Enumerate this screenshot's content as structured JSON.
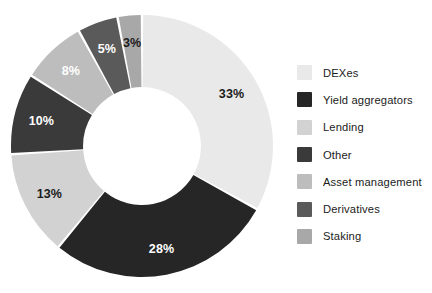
{
  "chart_data": {
    "type": "pie",
    "variant": "donut",
    "title": "",
    "subtitle": "",
    "xlabel": "",
    "ylabel": "",
    "units": "percent",
    "start_angle_deg": 0,
    "direction": "clockwise",
    "inner_radius_ratio": 0.45,
    "legend_position": "right",
    "grid": false,
    "categories": [
      "DEXes",
      "Yield aggregators",
      "Lending",
      "Other",
      "Asset management",
      "Derivatives",
      "Staking"
    ],
    "values": [
      33,
      28,
      13,
      10,
      8,
      5,
      3
    ],
    "data_labels": [
      "33%",
      "28%",
      "13%",
      "10%",
      "8%",
      "5%",
      "3%"
    ],
    "colors": [
      "#e9e9e9",
      "#262626",
      "#d2d2d2",
      "#3a3a3a",
      "#bdbdbd",
      "#5a5a5a",
      "#a8a8a8"
    ],
    "label_text_colors": [
      "#1b1b1b",
      "#ffffff",
      "#1b1b1b",
      "#ffffff",
      "#ffffff",
      "#ffffff",
      "#1b1b1b"
    ],
    "slices": [
      {
        "label": "DEXes",
        "value": 33,
        "data_label": "33%",
        "color": "#e9e9e9",
        "label_color": "#1b1b1b"
      },
      {
        "label": "Yield aggregators",
        "value": 28,
        "data_label": "28%",
        "color": "#262626",
        "label_color": "#ffffff"
      },
      {
        "label": "Lending",
        "value": 13,
        "data_label": "13%",
        "color": "#d2d2d2",
        "label_color": "#1b1b1b"
      },
      {
        "label": "Other",
        "value": 10,
        "data_label": "10%",
        "color": "#3a3a3a",
        "label_color": "#ffffff"
      },
      {
        "label": "Asset management",
        "value": 8,
        "data_label": "8%",
        "color": "#bdbdbd",
        "label_color": "#ffffff"
      },
      {
        "label": "Derivatives",
        "value": 5,
        "data_label": "5%",
        "color": "#5a5a5a",
        "label_color": "#ffffff"
      },
      {
        "label": "Staking",
        "value": 3,
        "data_label": "3%",
        "color": "#a8a8a8",
        "label_color": "#1b1b1b"
      }
    ]
  },
  "legend": {
    "items": [
      {
        "label": "DEXes",
        "color": "#e9e9e9"
      },
      {
        "label": "Yield aggregators",
        "color": "#262626"
      },
      {
        "label": "Lending",
        "color": "#d2d2d2"
      },
      {
        "label": "Other",
        "color": "#3a3a3a"
      },
      {
        "label": "Asset management",
        "color": "#bdbdbd"
      },
      {
        "label": "Derivatives",
        "color": "#5a5a5a"
      },
      {
        "label": "Staking",
        "color": "#a8a8a8"
      }
    ]
  },
  "background_color": "#ffffff"
}
